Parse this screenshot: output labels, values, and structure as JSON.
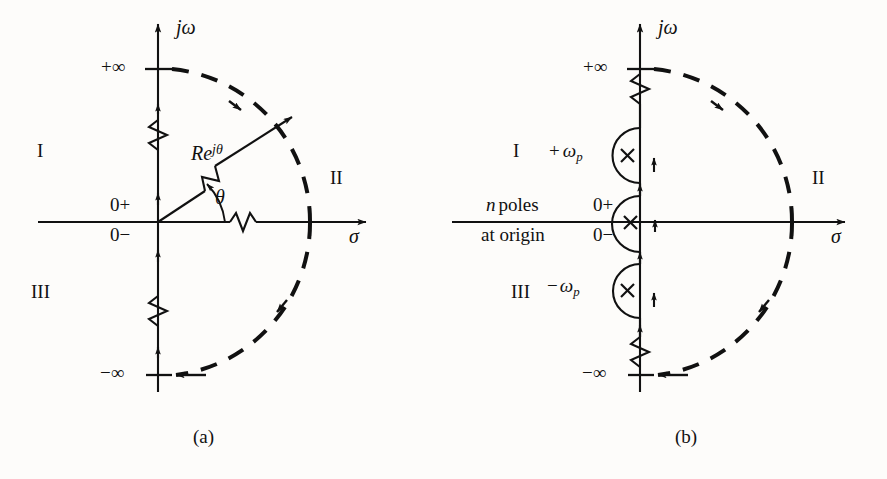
{
  "figure": {
    "type": "nyquist-contour-diagrams",
    "background_color": "#fdfcfa",
    "ink_color": "#111111",
    "panels": [
      {
        "id": "a",
        "caption": "(a)",
        "origin_px": [
          158,
          222
        ],
        "radius_px": 152,
        "axes": {
          "imaginary_label": "jω",
          "real_label": "σ",
          "tick_top_label": "+∞",
          "tick_bottom_label": "−∞",
          "origin_upper_label": "0+",
          "origin_lower_label": "0−"
        },
        "annotations": {
          "radius_vector_label_base": "Re",
          "radius_vector_label_exponent": "jθ",
          "angle_label": "θ"
        },
        "regions": [
          {
            "name": "region-I",
            "label": "I"
          },
          {
            "name": "region-II",
            "label": "II"
          },
          {
            "name": "region-III",
            "label": "III"
          }
        ]
      },
      {
        "id": "b",
        "caption": "(b)",
        "origin_px": [
          640,
          222
        ],
        "radius_px": 152,
        "axes": {
          "imaginary_label": "jω",
          "real_label": "σ",
          "tick_top_label": "+∞",
          "tick_bottom_label": "−∞",
          "origin_upper_label": "0+",
          "origin_lower_label": "0−"
        },
        "annotations": {
          "poles_note_line1_italic": "n",
          "poles_note_line1_rest": "poles",
          "poles_note_line2": "at origin",
          "pole_upper_sign": "+",
          "pole_upper_symbol": "ω",
          "pole_upper_subscript": "p",
          "pole_lower_sign": "−",
          "pole_lower_symbol": "ω",
          "pole_lower_subscript": "p",
          "pole_marker_glyph": "×"
        },
        "poles": [
          {
            "name": "pole-plus-omega-p",
            "position_px": [
              640,
              155
            ]
          },
          {
            "name": "pole-origin",
            "position_px": [
              630,
              222
            ]
          },
          {
            "name": "pole-minus-omega-p",
            "position_px": [
              640,
              290
            ]
          }
        ],
        "regions": [
          {
            "name": "region-I",
            "label": "I"
          },
          {
            "name": "region-II",
            "label": "II"
          },
          {
            "name": "region-III",
            "label": "III"
          }
        ]
      }
    ]
  }
}
